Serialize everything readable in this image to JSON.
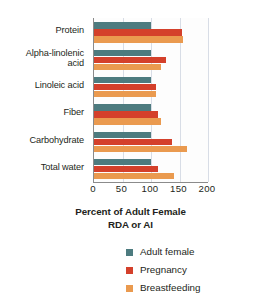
{
  "chart_data": {
    "type": "bar",
    "orientation": "horizontal",
    "title": "",
    "xlabel": "Percent of Adult Female RDA or AI",
    "ylabel": "",
    "xlim": [
      0,
      200
    ],
    "xticks": [
      0,
      50,
      100,
      150,
      200
    ],
    "grid": true,
    "legend_position": "bottom",
    "categories": [
      "Protein",
      "Alpha-linolenic acid",
      "Linoleic acid",
      "Fiber",
      "Carbohydrate",
      "Total water"
    ],
    "series": [
      {
        "name": "Adult female",
        "color": "#4d7b7f",
        "values": [
          100,
          100,
          100,
          100,
          100,
          100
        ]
      },
      {
        "name": "Pregnancy",
        "color": "#d4402b",
        "values": [
          155,
          127,
          108,
          112,
          136,
          112
        ]
      },
      {
        "name": "Breastfeeding",
        "color": "#ea9a4f",
        "values": [
          157,
          118,
          109,
          117,
          163,
          140
        ]
      }
    ]
  },
  "axis_title": {
    "line1": "Percent of Adult Female",
    "line2": "RDA or AI"
  },
  "category_labels": [
    {
      "line1": "Protein",
      "line2": ""
    },
    {
      "line1": "Alpha-linolenic",
      "line2": "acid"
    },
    {
      "line1": "Linoleic acid",
      "line2": ""
    },
    {
      "line1": "Fiber",
      "line2": ""
    },
    {
      "line1": "Carbohydrate",
      "line2": ""
    },
    {
      "line1": "Total water",
      "line2": ""
    }
  ],
  "tick_labels": [
    "0",
    "50",
    "100",
    "150",
    "200"
  ],
  "legend": [
    {
      "label": "Adult female",
      "color": "#4d7b7f"
    },
    {
      "label": "Pregnancy",
      "color": "#d4402b"
    },
    {
      "label": "Breastfeeding",
      "color": "#ea9a4f"
    }
  ],
  "colors": {
    "series_adult_female": "#4d7b7f",
    "series_pregnancy": "#d4402b",
    "series_breastfeeding": "#ea9a4f",
    "axis": "#8b8b8b",
    "grid": "#d8dde6",
    "text": "#231f20",
    "background": "#ffffff"
  }
}
